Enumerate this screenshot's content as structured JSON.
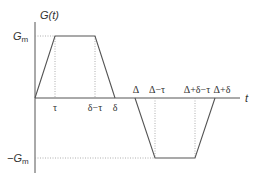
{
  "diagram": {
    "y_axis_label": "G(t)",
    "x_axis_label": "t",
    "levels": {
      "positive": {
        "label": "G",
        "sub": "m"
      },
      "negative": {
        "label": "−G",
        "sub": "m"
      }
    },
    "tick_labels": [
      "τ",
      "δ−τ",
      "δ",
      "Δ",
      "Δ−τ",
      "Δ+δ−τ",
      "Δ+δ"
    ],
    "colors": {
      "line": "#555555",
      "axis": "#555555",
      "dotted": "#999999",
      "text": "#333333"
    }
  }
}
